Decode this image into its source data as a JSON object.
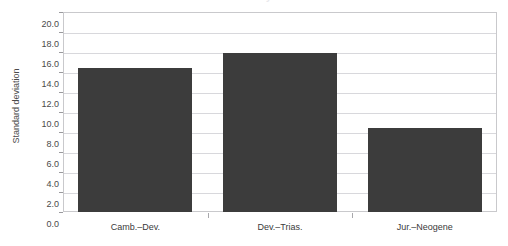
{
  "chart_data": {
    "type": "bar",
    "title": "Annual cycle",
    "title_clipped": true,
    "categories": [
      "Camb.–Dev.",
      "Dev.–Trias.",
      "Jur.–Neogene"
    ],
    "values": [
      14.4,
      15.9,
      8.4
    ],
    "xlabel": "",
    "ylabel": "Standard deviation",
    "ylim": [
      0.0,
      20.0
    ],
    "ytick_step": 2.0,
    "ytick_labels": [
      "0.0",
      "2.0",
      "4.0",
      "6.0",
      "8.0",
      "10.0",
      "12.0",
      "14.0",
      "16.0",
      "18.0",
      "20.0"
    ],
    "grid": "horizontal",
    "legend": "none",
    "bar_color": "#3c3c3c",
    "grid_color": "#d8d8dc",
    "frame_color": "#c9c9cc",
    "background": "#ffffff",
    "text_color": "#3a3a3a"
  }
}
